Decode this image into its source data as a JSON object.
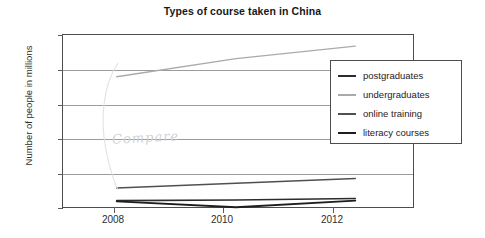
{
  "chart_data": {
    "type": "line",
    "title": "Types of course taken in China",
    "xlabel": "",
    "ylabel": "Number of people in millions",
    "x": [
      2008,
      2010,
      2012
    ],
    "xtick_labels": [
      "2008",
      "2010",
      "2012"
    ],
    "ytick_labels": [
      "0",
      "5",
      "10",
      "15",
      "20",
      "25"
    ],
    "yticks": [
      0,
      5,
      10,
      15,
      20,
      25
    ],
    "ylim": [
      0,
      25
    ],
    "xlim": [
      2007.1,
      2013.0
    ],
    "grid": "horizontal",
    "legend_position": "right-top-inside",
    "series": [
      {
        "name": "postgraduates",
        "color": "#2a2c2e",
        "values": [
          1.2,
          1.3,
          1.5
        ]
      },
      {
        "name": "undergraduates",
        "color": "#a8aaac",
        "values": [
          19.0,
          21.6,
          23.4
        ]
      },
      {
        "name": "online training",
        "color": "#4e5052",
        "values": [
          3.0,
          3.7,
          4.4
        ]
      },
      {
        "name": "literacy courses",
        "color": "#1c1e20",
        "values": [
          1.1,
          0.25,
          1.2
        ]
      }
    ],
    "annotations": [
      {
        "text": "Compare",
        "kind": "handwriting-pencil"
      }
    ]
  },
  "legend": {
    "items": [
      {
        "label": "postgraduates"
      },
      {
        "label": "undergraduates"
      },
      {
        "label": "online training"
      },
      {
        "label": "literacy courses"
      }
    ]
  }
}
